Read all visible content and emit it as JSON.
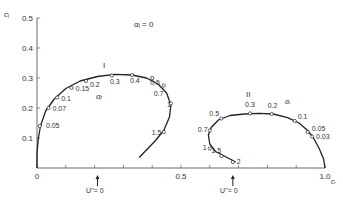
{
  "chart_data": {
    "type": "line",
    "title": "",
    "annotation_top": "αᵢ = 0",
    "xlabel": "cᵣ",
    "ylabel": "cᵢ",
    "xlim": [
      0,
      1.0
    ],
    "ylim": [
      0,
      0.5
    ],
    "x_ticks": [
      0,
      0.1,
      0.2,
      0.3,
      0.4,
      0.5,
      0.6,
      0.7,
      0.8,
      0.9,
      1.0
    ],
    "x_tick_labels": [
      {
        "v": 0,
        "t": "0"
      },
      {
        "v": 0.5,
        "t": "0.5"
      },
      {
        "v": 1.0,
        "t": "1.0"
      }
    ],
    "y_ticks": [
      0.1,
      0.2,
      0.3,
      0.4,
      0.5
    ],
    "y_tick_labels": [
      {
        "v": 0.1,
        "t": "0.1"
      },
      {
        "v": 0.2,
        "t": "0.2"
      },
      {
        "v": 0.3,
        "t": "0.3"
      },
      {
        "v": 0.4,
        "t": "0.4"
      },
      {
        "v": 0.5,
        "t": "0.5"
      }
    ],
    "grid": false,
    "markers_note": "U'' = 0",
    "markers": [
      {
        "x": 0.21,
        "label": "U''= 0"
      },
      {
        "x": 0.68,
        "label": "U''= 0"
      }
    ],
    "series": [
      {
        "name": "I",
        "param_label": "αᵣ",
        "curve": [
          [
            0.0,
            0.0
          ],
          [
            0.0,
            0.05
          ],
          [
            0.005,
            0.1
          ],
          [
            0.012,
            0.14
          ],
          [
            0.03,
            0.19
          ],
          [
            0.06,
            0.23
          ],
          [
            0.1,
            0.265
          ],
          [
            0.15,
            0.29
          ],
          [
            0.21,
            0.305
          ],
          [
            0.27,
            0.312
          ],
          [
            0.33,
            0.31
          ],
          [
            0.38,
            0.3
          ],
          [
            0.42,
            0.28
          ],
          [
            0.45,
            0.25
          ],
          [
            0.465,
            0.21
          ],
          [
            0.46,
            0.17
          ],
          [
            0.44,
            0.125
          ],
          [
            0.41,
            0.09
          ],
          [
            0.38,
            0.06
          ],
          [
            0.355,
            0.035
          ]
        ],
        "points": [
          {
            "param": "0.05",
            "cr": 0.01,
            "ci": 0.14
          },
          {
            "param": "0.07",
            "cr": 0.04,
            "ci": 0.2
          },
          {
            "param": "0.1",
            "cr": 0.07,
            "ci": 0.235
          },
          {
            "param": "0.15",
            "cr": 0.12,
            "ci": 0.267
          },
          {
            "param": "0.2",
            "cr": 0.17,
            "ci": 0.29
          },
          {
            "param": "0.3",
            "cr": 0.26,
            "ci": 0.308
          },
          {
            "param": "0.4",
            "cr": 0.33,
            "ci": 0.31
          },
          {
            "param": "0.5",
            "cr": 0.4,
            "ci": 0.3
          },
          {
            "param": "0.7",
            "cr": 0.44,
            "ci": 0.275
          },
          {
            "param": "1",
            "cr": 0.465,
            "ci": 0.215
          },
          {
            "param": "1.5",
            "cr": 0.44,
            "ci": 0.12
          }
        ]
      },
      {
        "name": "II",
        "param_label": "αᵣ",
        "curve": [
          [
            0.69,
            0.02
          ],
          [
            0.66,
            0.035
          ],
          [
            0.62,
            0.055
          ],
          [
            0.6,
            0.08
          ],
          [
            0.595,
            0.11
          ],
          [
            0.605,
            0.135
          ],
          [
            0.63,
            0.16
          ],
          [
            0.67,
            0.175
          ],
          [
            0.72,
            0.18
          ],
          [
            0.77,
            0.182
          ],
          [
            0.82,
            0.18
          ],
          [
            0.87,
            0.168
          ],
          [
            0.91,
            0.15
          ],
          [
            0.94,
            0.125
          ],
          [
            0.96,
            0.1
          ],
          [
            0.98,
            0.065
          ],
          [
            0.995,
            0.03
          ],
          [
            1.0,
            0.0
          ]
        ],
        "points": [
          {
            "param": "2",
            "cr": 0.68,
            "ci": 0.02
          },
          {
            "param": "1.5",
            "cr": 0.64,
            "ci": 0.04
          },
          {
            "param": "1",
            "cr": 0.6,
            "ci": 0.065
          },
          {
            "param": "0.7",
            "cr": 0.6,
            "ci": 0.125
          },
          {
            "param": "0.5",
            "cr": 0.64,
            "ci": 0.165
          },
          {
            "param": "0.3",
            "cr": 0.74,
            "ci": 0.182
          },
          {
            "param": "0.2",
            "cr": 0.815,
            "ci": 0.18
          },
          {
            "param": "0.1",
            "cr": 0.895,
            "ci": 0.157
          },
          {
            "param": "0.05",
            "cr": 0.94,
            "ci": 0.12
          },
          {
            "param": "0.03",
            "cr": 0.955,
            "ci": 0.105
          }
        ]
      }
    ]
  },
  "labels": {
    "y_axis": "cᵢ",
    "x_axis": "cᵣ",
    "top_annotation": "αᵢ = 0",
    "curve1_name": "I",
    "curve2_name": "II",
    "curve1_param": "αᵣ",
    "curve2_param": "αᵣ",
    "marker1": "U''= 0",
    "marker2": "U''= 0"
  }
}
